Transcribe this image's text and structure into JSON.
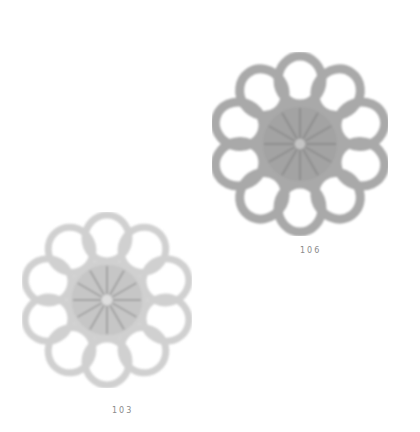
{
  "motifs": [
    {
      "id": "motif-106",
      "caption": "106",
      "description": "crochet flower motif, 10 loop petals, medium gray",
      "color": "#a9a9a9",
      "center_color": "#9a9a9a"
    },
    {
      "id": "motif-103",
      "caption": "103",
      "description": "crochet flower motif, 10 loop petals, light gray",
      "color": "#d0d0d0",
      "center_color": "#b4b4b4"
    }
  ]
}
